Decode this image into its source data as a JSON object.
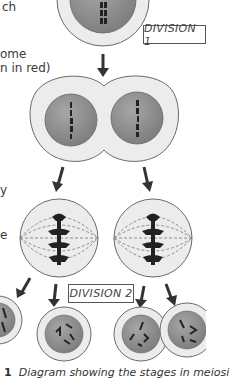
{
  "figure": {
    "side_text": [
      {
        "text": "ch",
        "x": 2,
        "y": 6
      },
      {
        "text": "ome",
        "x": 0,
        "y": 47
      },
      {
        "text": "n in red)",
        "x": 0,
        "y": 61
      },
      {
        "text": "y",
        "x": 0,
        "y": 183
      },
      {
        "text": "e",
        "x": 0,
        "y": 228
      }
    ],
    "labels": {
      "division_1": "DIVISION 1",
      "division_2": "DIVISION 2"
    },
    "caption": {
      "number": "1",
      "text": "Diagram showing the stages in meiosi"
    },
    "colors": {
      "cytoplasm": "#ececec",
      "cell_outline": "#6a6a6a",
      "nucleus": "#8f8f8f",
      "chromosome": "#222222",
      "arrow": "#333333",
      "spindle": "#777777"
    },
    "stages": [
      "parent cell (top)",
      "dividing cell with two nuclei",
      "two cells with spindles",
      "four daughter cells"
    ]
  }
}
